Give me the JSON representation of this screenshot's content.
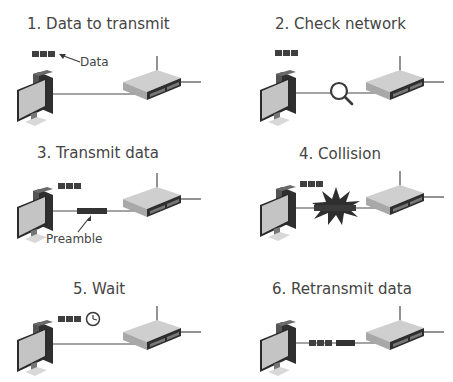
{
  "diagram": {
    "steps": [
      {
        "number": 1,
        "title": "1. Data to transmit",
        "annotation": "Data"
      },
      {
        "number": 2,
        "title": "2. Check network"
      },
      {
        "number": 3,
        "title": "3. Transmit data",
        "annotation": "Preamble"
      },
      {
        "number": 4,
        "title": "4. Collision"
      },
      {
        "number": 5,
        "title": "5. Wait"
      },
      {
        "number": 6,
        "title": "6. Retransmit data"
      }
    ],
    "icons": [
      "computer-icon",
      "network-switch-icon",
      "data-blocks-icon",
      "magnifier-icon",
      "preamble-frame-icon",
      "collision-burst-icon",
      "clock-icon",
      "cable-line"
    ],
    "colors": {
      "data_block": "#3f3f3f",
      "cable": "#4a4a4a",
      "switch_body": "#c9c9c9",
      "monitor_screen": "#c2c2c2",
      "text": "#444444"
    }
  }
}
